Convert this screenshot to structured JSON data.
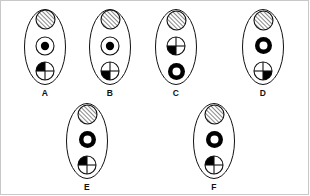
{
  "page": {
    "background_color": "#ffffff",
    "line_color": "#111111",
    "fill_color": "#000000"
  },
  "glyph_types": {
    "hatched": "hatched-circle",
    "dot": "dot-in-circle",
    "ring": "thick-ring-circle",
    "quad_ul": "quartered-circle-upper-left-filled",
    "quad_ll": "quartered-circle-lower-left-filled",
    "quad_lr": "quartered-circle-lower-right-filled"
  },
  "options": [
    {
      "label": "A",
      "shapes": [
        "hatched",
        "dot",
        "quad_ul"
      ],
      "x": 14,
      "y": 8
    },
    {
      "label": "B",
      "shapes": [
        "hatched",
        "dot",
        "quad_ll"
      ],
      "x": 79,
      "y": 8
    },
    {
      "label": "C",
      "shapes": [
        "hatched",
        "quad_ll",
        "ring"
      ],
      "x": 145,
      "y": 8
    },
    {
      "label": "D",
      "shapes": [
        "hatched",
        "ring",
        "quad_lr"
      ],
      "x": 232,
      "y": 8
    },
    {
      "label": "E",
      "shapes": [
        "hatched",
        "ring",
        "quad_ul"
      ],
      "x": 56,
      "y": 102
    },
    {
      "label": "F",
      "shapes": [
        "hatched",
        "ring",
        "quad_ul"
      ],
      "x": 183,
      "y": 102
    }
  ]
}
